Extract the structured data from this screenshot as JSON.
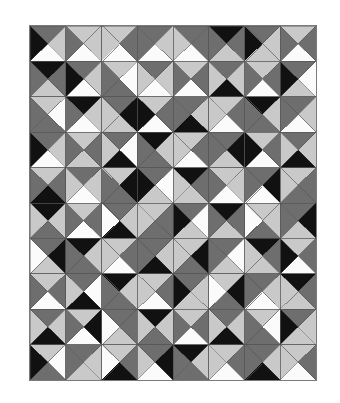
{
  "artwork": {
    "title": "Four-patch half-square triangle quilt pattern",
    "medium": "grayscale tessellation",
    "background_color": "#ffffff",
    "frame_color": "#7a7a7a",
    "grid_line_color": "#555555",
    "columns": 8,
    "rows": 10,
    "cell_width": 35.75,
    "cell_height": 35.4,
    "tone_names": [
      "black",
      "dark-gray",
      "light-gray",
      "white"
    ],
    "tones": {
      "k": "#111111",
      "d": "#6e6e6e",
      "l": "#c9c9c9",
      "w": "#fbfbfb"
    }
  },
  "chart_data": {
    "type": "heatmap",
    "xlabel": "",
    "ylabel": "",
    "grid": true,
    "legend": "none",
    "columns": 8,
    "rows": 10,
    "palette": {
      "k": "#111111",
      "d": "#6e6e6e",
      "l": "#c9c9c9",
      "w": "#fbfbfb"
    },
    "cell_order": [
      "top",
      "right",
      "bottom",
      "left"
    ],
    "cells": [
      [
        [
          "d",
          "l",
          "w",
          "k"
        ],
        [
          "l",
          "l",
          "w",
          "d"
        ],
        [
          "l",
          "d",
          "w",
          "l"
        ],
        [
          "d",
          "l",
          "w",
          "d"
        ],
        [
          "d",
          "d",
          "w",
          "l"
        ],
        [
          "k",
          "d",
          "l",
          "d"
        ],
        [
          "d",
          "l",
          "l",
          "k"
        ],
        [
          "l",
          "d",
          "w",
          "d"
        ]
      ],
      [
        [
          "k",
          "d",
          "l",
          "d"
        ],
        [
          "d",
          "l",
          "w",
          "k"
        ],
        [
          "l",
          "w",
          "d",
          "d"
        ],
        [
          "d",
          "l",
          "w",
          "l"
        ],
        [
          "l",
          "d",
          "w",
          "d"
        ],
        [
          "d",
          "l",
          "k",
          "l"
        ],
        [
          "l",
          "d",
          "w",
          "d"
        ],
        [
          "d",
          "w",
          "l",
          "k"
        ]
      ],
      [
        [
          "l",
          "w",
          "d",
          "d"
        ],
        [
          "k",
          "l",
          "w",
          "d"
        ],
        [
          "d",
          "k",
          "l",
          "l"
        ],
        [
          "l",
          "d",
          "w",
          "k"
        ],
        [
          "d",
          "l",
          "k",
          "d"
        ],
        [
          "l",
          "d",
          "w",
          "l"
        ],
        [
          "k",
          "l",
          "d",
          "d"
        ],
        [
          "d",
          "l",
          "w",
          "d"
        ]
      ],
      [
        [
          "d",
          "l",
          "w",
          "k"
        ],
        [
          "l",
          "d",
          "l",
          "d"
        ],
        [
          "d",
          "w",
          "k",
          "l"
        ],
        [
          "k",
          "l",
          "d",
          "d"
        ],
        [
          "l",
          "d",
          "w",
          "l"
        ],
        [
          "d",
          "k",
          "l",
          "d"
        ],
        [
          "l",
          "d",
          "w",
          "k"
        ],
        [
          "d",
          "l",
          "k",
          "l"
        ]
      ],
      [
        [
          "l",
          "d",
          "k",
          "d"
        ],
        [
          "d",
          "l",
          "w",
          "l"
        ],
        [
          "l",
          "k",
          "d",
          "d"
        ],
        [
          "d",
          "w",
          "l",
          "k"
        ],
        [
          "k",
          "d",
          "l",
          "l"
        ],
        [
          "l",
          "l",
          "w",
          "d"
        ],
        [
          "d",
          "k",
          "w",
          "d"
        ],
        [
          "l",
          "d",
          "d",
          "l"
        ]
      ],
      [
        [
          "k",
          "l",
          "d",
          "l"
        ],
        [
          "l",
          "d",
          "w",
          "d"
        ],
        [
          "d",
          "l",
          "k",
          "w"
        ],
        [
          "l",
          "d",
          "d",
          "l"
        ],
        [
          "d",
          "w",
          "l",
          "k"
        ],
        [
          "k",
          "d",
          "l",
          "d"
        ],
        [
          "l",
          "l",
          "d",
          "w"
        ],
        [
          "d",
          "k",
          "l",
          "d"
        ]
      ],
      [
        [
          "d",
          "k",
          "l",
          "w"
        ],
        [
          "k",
          "l",
          "d",
          "d"
        ],
        [
          "l",
          "d",
          "w",
          "l"
        ],
        [
          "d",
          "l",
          "k",
          "d"
        ],
        [
          "l",
          "k",
          "d",
          "l"
        ],
        [
          "d",
          "w",
          "l",
          "d"
        ],
        [
          "k",
          "d",
          "l",
          "l"
        ],
        [
          "l",
          "d",
          "w",
          "k"
        ]
      ],
      [
        [
          "l",
          "d",
          "w",
          "d"
        ],
        [
          "d",
          "w",
          "k",
          "l"
        ],
        [
          "k",
          "l",
          "d",
          "d"
        ],
        [
          "l",
          "d",
          "w",
          "l"
        ],
        [
          "d",
          "l",
          "l",
          "k"
        ],
        [
          "l",
          "k",
          "d",
          "w"
        ],
        [
          "d",
          "l",
          "w",
          "d"
        ],
        [
          "k",
          "d",
          "l",
          "l"
        ]
      ],
      [
        [
          "d",
          "l",
          "k",
          "l"
        ],
        [
          "l",
          "k",
          "w",
          "d"
        ],
        [
          "d",
          "d",
          "l",
          "w"
        ],
        [
          "k",
          "l",
          "d",
          "l"
        ],
        [
          "l",
          "d",
          "w",
          "d"
        ],
        [
          "d",
          "l",
          "k",
          "l"
        ],
        [
          "l",
          "w",
          "d",
          "d"
        ],
        [
          "d",
          "l",
          "l",
          "k"
        ]
      ],
      [
        [
          "l",
          "w",
          "d",
          "k"
        ],
        [
          "d",
          "l",
          "l",
          "d"
        ],
        [
          "l",
          "d",
          "k",
          "w"
        ],
        [
          "d",
          "k",
          "w",
          "l"
        ],
        [
          "k",
          "l",
          "d",
          "d"
        ],
        [
          "l",
          "d",
          "w",
          "l"
        ],
        [
          "d",
          "l",
          "k",
          "d"
        ],
        [
          "l",
          "d",
          "w",
          "l"
        ]
      ]
    ]
  }
}
